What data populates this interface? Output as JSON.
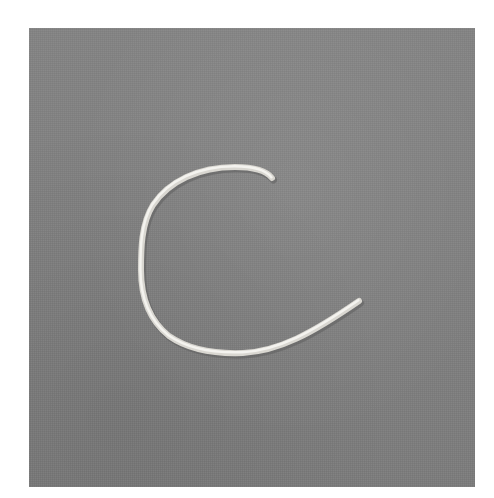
{
  "image": {
    "description": "Photograph of a white cord shaped into the letter C on a gray fabric background",
    "subject": "C",
    "colors": {
      "background_page": "#ffffff",
      "fabric": "#808080",
      "cord": "#e8e6e0",
      "cord_shadow": "#5e5e5e"
    }
  }
}
